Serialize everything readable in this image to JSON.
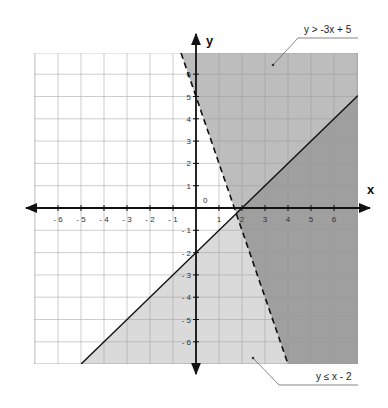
{
  "chart_data": {
    "type": "area",
    "title": "",
    "xlabel": "x",
    "ylabel": "y",
    "xlim": [
      -7,
      7
    ],
    "ylim": [
      -7,
      7
    ],
    "grid": true,
    "origin_label": "0",
    "x_ticks": [
      -6,
      -5,
      -4,
      -3,
      -2,
      -1,
      1,
      2,
      3,
      4,
      5,
      6
    ],
    "y_ticks": [
      6,
      5,
      4,
      3,
      2,
      1,
      -1,
      -2,
      -3,
      -4,
      -5,
      -6
    ],
    "x_tick_labels": [
      "- 6",
      "- 5",
      "- 4",
      "- 3",
      "- 2",
      "- 1",
      "1",
      "2",
      "3",
      "4",
      "5",
      "6"
    ],
    "y_tick_labels": [
      "6",
      "5",
      "4",
      "3",
      "2",
      "1",
      "- 1",
      "- 2",
      "- 3",
      "- 4",
      "- 5",
      "- 6"
    ],
    "series": [
      {
        "name": "y > -3x + 5",
        "boundary": {
          "slope": -3,
          "intercept": 5
        },
        "line_style": "dashed",
        "shade": "above",
        "points": [
          [
            0.67,
            7
          ],
          [
            0,
            5
          ],
          [
            1.67,
            0
          ],
          [
            4,
            -7
          ]
        ],
        "fill": "#b9b9b9"
      },
      {
        "name": "y ≤ x - 2",
        "boundary": {
          "slope": 1,
          "intercept": -2
        },
        "line_style": "solid",
        "shade": "below",
        "points": [
          [
            -5,
            -7
          ],
          [
            0,
            -2
          ],
          [
            2,
            0
          ],
          [
            7,
            5
          ]
        ],
        "fill": "#d9d9d9"
      }
    ],
    "annotations": [
      {
        "text": "y > -3x + 5",
        "points_to": [
          3.4,
          6
        ]
      },
      {
        "text": "y ≤ x - 2",
        "points_to": [
          2.5,
          -6.6
        ]
      }
    ],
    "colors": {
      "region_a": "#bdbdbd",
      "region_b": "#dadada",
      "overlap": "#9f9f9f",
      "grid": "#9a9a9a",
      "axis": "#111111"
    }
  }
}
